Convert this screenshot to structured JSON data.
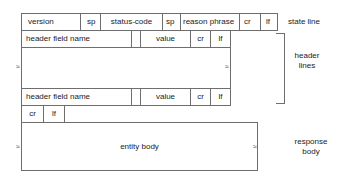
{
  "state_line": {
    "fields": [
      "version",
      "sp",
      "status-code",
      "sp",
      "reason phrase",
      "cr",
      "lf"
    ],
    "label": "state line"
  },
  "header_lines": {
    "first": {
      "name": "header field name",
      "value": "value",
      "cr": "cr",
      "lf": "lf"
    },
    "last": {
      "name": "header field name",
      "value": "value",
      "cr": "cr",
      "lf": "lf"
    },
    "continuation_mark": "≈",
    "label_line1": "header",
    "label_line2": "lines"
  },
  "blank_line": {
    "cr": "cr",
    "lf": "lf"
  },
  "entity": {
    "body": "entity body",
    "continuation_mark": "≈",
    "label_line1": "response",
    "label_line2": "body"
  }
}
